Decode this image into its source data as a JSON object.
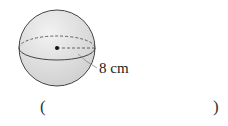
{
  "figure": {
    "shape": "sphere",
    "radius_label": "8 cm",
    "center_marker": "dot"
  },
  "answer": {
    "open_paren": "(",
    "close_paren": ")",
    "value": ""
  }
}
